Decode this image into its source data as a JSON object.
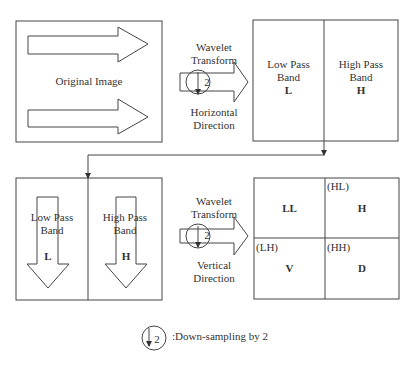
{
  "original": {
    "label": "Original Image"
  },
  "step1": {
    "line1": "Wavelet",
    "line2": "Transform",
    "dir1": "Horizontal",
    "dir2": "Direction",
    "factor": "2"
  },
  "band_h": {
    "low": {
      "line1": "Low Pass",
      "line2": "Band",
      "sym": "L"
    },
    "high": {
      "line1": "High Pass",
      "line2": "Band",
      "sym": "H"
    }
  },
  "band_v": {
    "low": {
      "line1": "Low Pass",
      "line2": "Band",
      "sym": "L"
    },
    "high": {
      "line1": "High Pass",
      "line2": "Band",
      "sym": "H"
    }
  },
  "step2": {
    "line1": "Wavelet",
    "line2": "Transform",
    "dir1": "Vertical",
    "dir2": "Direction",
    "factor": "2"
  },
  "quad": {
    "ll": {
      "sym": "LL"
    },
    "hl": {
      "tag": "(HL)",
      "sym": "H"
    },
    "lh": {
      "tag": "(LH)",
      "sym": "V"
    },
    "hh": {
      "tag": "(HH)",
      "sym": "D"
    }
  },
  "legend": {
    "factor": "2",
    "text": ":Down-sampling by 2"
  }
}
